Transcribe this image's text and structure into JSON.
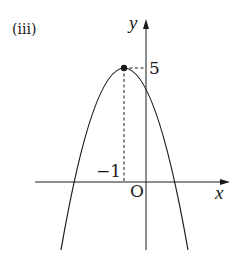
{
  "figure": {
    "panel_label": "(iii)",
    "axes": {
      "x_label": "x",
      "y_label": "y",
      "origin_label": "O"
    },
    "vertex": {
      "x": -1,
      "y": 5,
      "x_label": "−1",
      "y_label": "5"
    },
    "curve": {
      "type": "parabola",
      "opens": "down",
      "equation": "y = -(x+1)^2 + 5"
    },
    "colors": {
      "stroke": "#1a1a1a",
      "background": "#ffffff"
    }
  }
}
